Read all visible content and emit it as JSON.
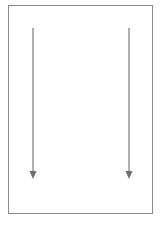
{
  "diagram": {
    "frame": {
      "stroke_color": "#8a8a8a"
    },
    "arrows": [
      {
        "name": "left-down-arrow",
        "direction": "down",
        "x": 33,
        "y_start": 28,
        "y_end": 179,
        "color": "#7a7a7a"
      },
      {
        "name": "right-down-arrow",
        "direction": "down",
        "x": 129,
        "y_start": 28,
        "y_end": 179,
        "color": "#7a7a7a"
      }
    ]
  }
}
